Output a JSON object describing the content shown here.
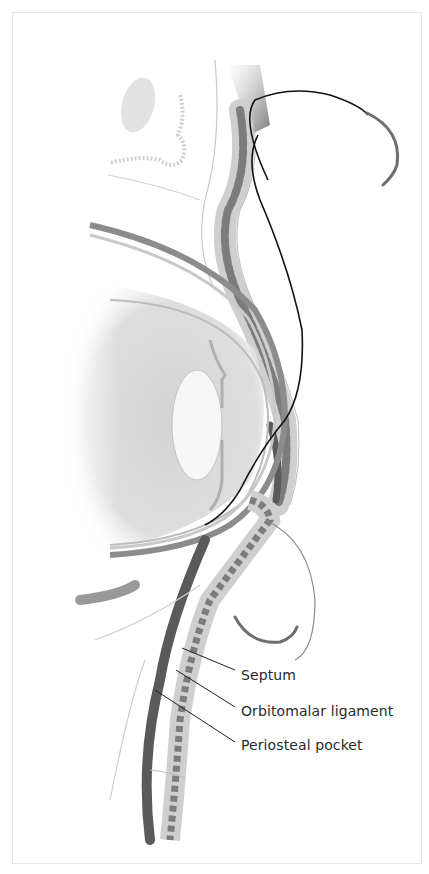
{
  "figure": {
    "labels": [
      {
        "id": "septum",
        "text": "Septum"
      },
      {
        "id": "orbitomalar-ligament",
        "text": "Orbitomalar ligament"
      },
      {
        "id": "periosteal-pocket",
        "text": "Periosteal pocket"
      }
    ],
    "colors": {
      "background": "#ffffff",
      "frame": "#e6e6e6",
      "suture": "#111111",
      "needle": "#6e6e6e",
      "tissue_dark": "#5a5a5a",
      "tissue_mid": "#9a9a9a",
      "tissue_light": "#d6d6d6",
      "label_text": "#2a2a2a"
    }
  }
}
